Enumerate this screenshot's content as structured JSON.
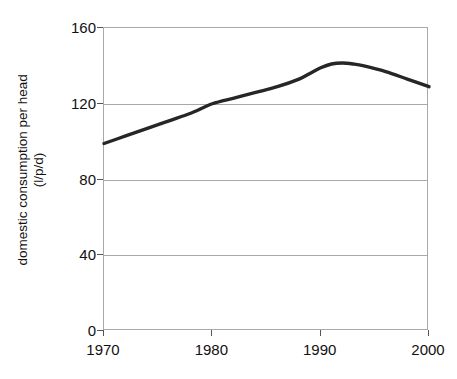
{
  "chart_data": {
    "type": "line",
    "title": "",
    "xlabel": "",
    "ylabel": "domestic consumption per head (l/p/d)",
    "ylabel_line1": "domestic consumption per head",
    "ylabel_line2": "(l/p/d)",
    "xlim": [
      1970,
      2000
    ],
    "ylim": [
      0,
      160
    ],
    "grid": true,
    "legend": "none",
    "line_color": "#262626",
    "grid_color": "#a9a9a9",
    "y_ticks": [
      {
        "value": 160,
        "label": "160"
      },
      {
        "value": 120,
        "label": "120"
      },
      {
        "value": 80,
        "label": "80"
      },
      {
        "value": 40,
        "label": "40"
      },
      {
        "value": 0,
        "label": "0"
      }
    ],
    "x_ticks": [
      {
        "value": 1970,
        "label": "1970"
      },
      {
        "value": 1980,
        "label": "1980"
      },
      {
        "value": 1990,
        "label": "1990"
      },
      {
        "value": 2000,
        "label": "2000"
      }
    ],
    "series": [
      {
        "name": "domestic consumption per head",
        "x": [
          1970,
          1972,
          1974,
          1976,
          1978,
          1980,
          1982,
          1984,
          1986,
          1988,
          1989,
          1990,
          1991,
          1992,
          1993,
          1994,
          1996,
          1998,
          2000
        ],
        "values": [
          99,
          103,
          107,
          111,
          115,
          120,
          123,
          126,
          129,
          133,
          136,
          139,
          141,
          141.5,
          141,
          140,
          137,
          133,
          129
        ]
      }
    ]
  }
}
